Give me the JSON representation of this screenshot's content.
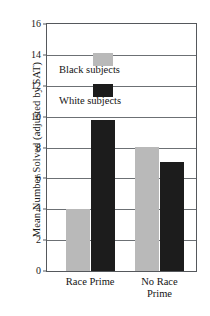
{
  "chart_data": {
    "type": "bar",
    "title": "",
    "xlabel": "",
    "ylabel": "Mean Number Solved (adjusted by SAT)",
    "categories": [
      "Race Prime",
      "No Race Prime"
    ],
    "series": [
      {
        "name": "Black subjects",
        "color": "#b9b9b9",
        "values": [
          4.0,
          8.05
        ]
      },
      {
        "name": "White subjects",
        "color": "#1c1c1c",
        "values": [
          9.8,
          7.05
        ]
      }
    ],
    "ylim": [
      0,
      16
    ],
    "yticks": [
      0,
      2,
      4,
      6,
      8,
      10,
      12,
      14,
      16
    ],
    "ytick_labels": [
      "0",
      "2",
      "4",
      "6",
      "8",
      "10",
      "12",
      "14",
      "16"
    ],
    "grid": true,
    "legend_position": "inside-upper-left",
    "legend": [
      {
        "label": "Black subjects",
        "color": "#b9b9b9"
      },
      {
        "label": "White subjects",
        "color": "#1c1c1c"
      }
    ],
    "category_label_lines": [
      [
        "Race Prime"
      ],
      [
        "No Race",
        "Prime"
      ]
    ],
    "axis_color": "#55585c",
    "grid_color": "#6c7074",
    "background": "#ffffff"
  }
}
